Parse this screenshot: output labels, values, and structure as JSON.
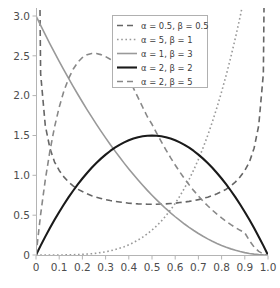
{
  "chart_data": {
    "type": "line",
    "title": "",
    "xlabel": "",
    "ylabel": "",
    "xlim": [
      0,
      1
    ],
    "ylim": [
      0,
      3.1
    ],
    "grid": false,
    "legend_position": "top-center",
    "xticks": [
      "0",
      "0.1",
      "0.2",
      "0.3",
      "0.4",
      "0.5",
      "0.6",
      "0.7",
      "0.8",
      "0.9",
      "1.0"
    ],
    "xtick_values": [
      0,
      0.1,
      0.2,
      0.3,
      0.4,
      0.5,
      0.6,
      0.7,
      0.8,
      0.9,
      1.0
    ],
    "yticks": [
      "0",
      "0.5",
      "1.0",
      "1.5",
      "2.0",
      "2.5",
      "3.0"
    ],
    "ytick_values": [
      0,
      0.5,
      1.0,
      1.5,
      2.0,
      2.5,
      3.0
    ],
    "x": [
      0.0,
      0.02,
      0.04,
      0.06,
      0.08,
      0.1,
      0.12,
      0.14,
      0.16,
      0.18,
      0.2,
      0.22,
      0.24,
      0.26,
      0.28,
      0.3,
      0.32,
      0.34,
      0.36,
      0.38,
      0.4,
      0.42,
      0.44,
      0.46,
      0.48,
      0.5,
      0.52,
      0.54,
      0.56,
      0.58,
      0.6,
      0.62,
      0.64,
      0.66,
      0.68,
      0.7,
      0.72,
      0.74,
      0.76,
      0.78,
      0.8,
      0.82,
      0.84,
      0.86,
      0.88,
      0.9,
      0.92,
      0.94,
      0.96,
      0.98,
      1.0
    ],
    "series": [
      {
        "name": "alpha = 0.5, beta = 0.5",
        "label": "α = 0.5, β = 0.5",
        "alpha": 0.5,
        "beta": 0.5,
        "color": "#666666",
        "linestyle": "dashed",
        "linewidth": 1.6,
        "dasharray": "6,4",
        "values": [
          9.99,
          2.274,
          1.625,
          1.34,
          1.167,
          1.061,
          0.981,
          0.918,
          0.867,
          0.826,
          0.796,
          0.768,
          0.745,
          0.726,
          0.71,
          0.695,
          0.683,
          0.673,
          0.665,
          0.658,
          0.65,
          0.646,
          0.642,
          0.64,
          0.637,
          0.637,
          0.637,
          0.64,
          0.642,
          0.646,
          0.65,
          0.658,
          0.665,
          0.673,
          0.683,
          0.695,
          0.71,
          0.726,
          0.745,
          0.768,
          0.796,
          0.826,
          0.867,
          0.918,
          0.981,
          1.061,
          1.167,
          1.34,
          1.625,
          2.274,
          9.99
        ]
      },
      {
        "name": "alpha = 5, beta = 1",
        "label": "α = 5, β = 1",
        "alpha": 5,
        "beta": 1,
        "color": "#999999",
        "linestyle": "dotted",
        "linewidth": 1.6,
        "dasharray": "1.6,2.6",
        "values": [
          0.0,
          8e-07,
          1.28e-05,
          6.48e-05,
          0.000205,
          0.0005,
          0.001037,
          0.00192,
          0.003277,
          0.005249,
          0.008,
          0.011713,
          0.016589,
          0.022851,
          0.030739,
          0.0405,
          0.05243,
          0.06683,
          0.08398,
          0.10425,
          0.128,
          0.15563,
          0.18754,
          0.22418,
          0.26598,
          0.3125,
          0.36575,
          0.42515,
          0.49169,
          0.5659,
          0.648,
          0.73882,
          0.83886,
          0.94869,
          1.0689,
          1.2005,
          1.344,
          1.4998,
          1.6686,
          1.8515,
          2.048,
          2.2596,
          2.4869,
          2.7306,
          2.9916,
          3.2805,
          3.5966,
          3.9092,
          4.2467,
          4.6097,
          5.0
        ]
      },
      {
        "name": "alpha = 1, beta = 3",
        "label": "α = 1, β = 3",
        "alpha": 1,
        "beta": 3,
        "color": "#999999",
        "linestyle": "solid",
        "linewidth": 1.6,
        "dasharray": "",
        "values": [
          3.0,
          2.8812,
          2.7648,
          2.6508,
          2.5392,
          2.43,
          2.3232,
          2.2188,
          2.1168,
          2.0172,
          1.92,
          1.8252,
          1.7328,
          1.6428,
          1.5552,
          1.47,
          1.3872,
          1.3068,
          1.2288,
          1.1532,
          1.08,
          1.0092,
          0.9408,
          0.8748,
          0.8112,
          0.75,
          0.6912,
          0.6348,
          0.5808,
          0.5292,
          0.48,
          0.4332,
          0.3888,
          0.3468,
          0.3072,
          0.27,
          0.2352,
          0.2028,
          0.1728,
          0.1452,
          0.12,
          0.0972,
          0.0768,
          0.0588,
          0.0432,
          0.03,
          0.0192,
          0.0108,
          0.0048,
          0.0012,
          0.0
        ]
      },
      {
        "name": "alpha = 2, beta = 2",
        "label": "α = 2, β = 2",
        "alpha": 2,
        "beta": 2,
        "color": "#1a1a1a",
        "linestyle": "solid",
        "linewidth": 2.1,
        "dasharray": "",
        "values": [
          0.0,
          0.1176,
          0.2304,
          0.3384,
          0.4416,
          0.54,
          0.6336,
          0.7224,
          0.8064,
          0.8856,
          0.96,
          1.0296,
          1.0944,
          1.1544,
          1.2096,
          1.26,
          1.3056,
          1.3464,
          1.3824,
          1.4136,
          1.44,
          1.4616,
          1.4784,
          1.4904,
          1.4976,
          1.5,
          1.4976,
          1.4904,
          1.4784,
          1.4616,
          1.44,
          1.4136,
          1.3824,
          1.3464,
          1.3056,
          1.26,
          1.2096,
          1.1544,
          1.0944,
          1.0296,
          0.96,
          0.8856,
          0.8064,
          0.7224,
          0.6336,
          0.54,
          0.4416,
          0.3384,
          0.2304,
          0.1176,
          0.0
        ]
      },
      {
        "name": "alpha = 2, beta = 5",
        "label": "α = 2, β = 5",
        "alpha": 2,
        "beta": 5,
        "color": "#888888",
        "linestyle": "dashed",
        "linewidth": 1.6,
        "dasharray": "6,4",
        "values": [
          0.0,
          0.5099,
          0.9424,
          1.306,
          1.608,
          1.8555,
          2.0547,
          2.2114,
          2.331,
          2.4183,
          2.478,
          2.5139,
          2.5298,
          2.5291,
          2.5148,
          2.4897,
          2.456,
          2.4161,
          2.3717,
          2.3245,
          2.2118,
          2.0943,
          1.9745,
          1.8542,
          1.7351,
          1.6406,
          1.5296,
          1.4225,
          1.3199,
          1.222,
          1.129,
          1.0411,
          0.9583,
          0.8806,
          0.8079,
          0.7399,
          0.6766,
          0.6177,
          0.563,
          0.5122,
          0.4652,
          0.4216,
          0.3813,
          0.3441,
          0.3097,
          0.278,
          0.18,
          0.1,
          0.045,
          0.012,
          0.0
        ]
      }
    ]
  },
  "axes": {
    "x_axis_name": "x-axis",
    "y_axis_name": "y-axis"
  },
  "legend": {
    "entries": [
      {
        "label": "α = 0.5, β = 0.5"
      },
      {
        "label": "α = 5, β = 1"
      },
      {
        "label": "α = 1, β = 3"
      },
      {
        "label": "α = 2, β = 2"
      },
      {
        "label": "α = 2, β = 5"
      }
    ]
  },
  "colors": {
    "background": "#ffffff",
    "spine": "#b4b4b4",
    "tick_text": "#4d4d4d",
    "legend_border": "#b0b0b0"
  }
}
